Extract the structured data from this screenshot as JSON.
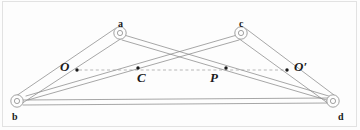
{
  "figure": {
    "type": "mechanical-linkage-diagram",
    "background_color": "#fdfdfd",
    "line_color": "#8a8a8a",
    "dash_color": "#9a9a9a",
    "label_color": "#1a1a1a",
    "width": 360,
    "height": 130
  },
  "joints": [
    {
      "name": "b",
      "label": "b",
      "cx": 17,
      "cy": 101,
      "r_outer": 6.2,
      "r_inner": 2.6,
      "label_x": 12,
      "label_y": 112
    },
    {
      "name": "a",
      "label": "a",
      "cx": 120,
      "cy": 33,
      "r_outer": 6.2,
      "r_inner": 2.6,
      "label_x": 118,
      "label_y": 19
    },
    {
      "name": "c",
      "label": "c",
      "cx": 241,
      "cy": 33,
      "r_outer": 6.2,
      "r_inner": 2.6,
      "label_x": 239,
      "label_y": 19
    },
    {
      "name": "d",
      "label": "d",
      "cx": 333,
      "cy": 101,
      "r_outer": 6.2,
      "r_inner": 2.6,
      "label_x": 338,
      "label_y": 112
    }
  ],
  "points": [
    {
      "name": "O",
      "label": "O",
      "dot_x": 77,
      "dot_y": 70,
      "label_x": 60,
      "label_y": 60
    },
    {
      "name": "C",
      "label": "C",
      "dot_x": 138,
      "dot_y": 68,
      "label_x": 137,
      "label_y": 71
    },
    {
      "name": "P",
      "label": "P",
      "dot_x": 226,
      "dot_y": 68,
      "label_x": 210,
      "label_y": 71
    },
    {
      "name": "O-prime",
      "label": "O′",
      "dot_x": 287,
      "dot_y": 70,
      "label_x": 294,
      "label_y": 60
    }
  ],
  "links": [
    {
      "name": "bar-b-a-upper",
      "x1": 16,
      "y1": 96,
      "x2": 116,
      "y2": 28
    },
    {
      "name": "bar-b-a-lower",
      "x1": 21,
      "y1": 104,
      "x2": 122,
      "y2": 38
    },
    {
      "name": "bar-c-d-upper",
      "x1": 245,
      "y1": 28,
      "x2": 334,
      "y2": 95
    },
    {
      "name": "bar-c-d-lower",
      "x1": 238,
      "y1": 38,
      "x2": 329,
      "y2": 104
    },
    {
      "name": "bar-b-d-upper",
      "x1": 23,
      "y1": 100,
      "x2": 331,
      "y2": 98
    },
    {
      "name": "bar-b-d-lower",
      "x1": 23,
      "y1": 105,
      "x2": 331,
      "y2": 103
    },
    {
      "name": "diagonal-a-d-upper",
      "x1": 124,
      "y1": 35,
      "x2": 332,
      "y2": 97
    },
    {
      "name": "diagonal-a-d-lower",
      "x1": 122,
      "y1": 40,
      "x2": 330,
      "y2": 101
    },
    {
      "name": "diagonal-c-b-upper",
      "x1": 237,
      "y1": 35,
      "x2": 26,
      "y2": 96
    },
    {
      "name": "diagonal-c-b-lower",
      "x1": 239,
      "y1": 40,
      "x2": 28,
      "y2": 100
    }
  ],
  "dashed_line": {
    "name": "line-O-to-O-prime",
    "x1": 79,
    "y1": 70,
    "x2": 285,
    "y2": 70
  }
}
